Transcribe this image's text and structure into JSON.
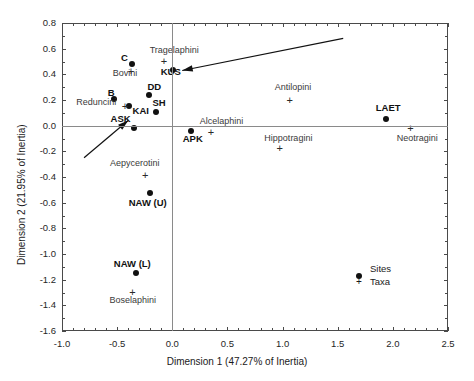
{
  "chart_data": {
    "type": "scatter",
    "title": "",
    "xlabel": "Dimension 1 (47.27% of Inertia)",
    "ylabel": "Dimension 2 (21.95% of Inertia)",
    "xlim": [
      -1.0,
      2.5
    ],
    "ylim": [
      -1.6,
      0.8
    ],
    "xticks": [
      "-1.0",
      "-0.5",
      "0.0",
      "0.5",
      "1.0",
      "1.5",
      "2.0",
      "2.5"
    ],
    "xtick_values": [
      -1.0,
      -0.5,
      0.0,
      0.5,
      1.0,
      1.5,
      2.0,
      2.5
    ],
    "yticks": [
      "0.8",
      "0.6",
      "0.4",
      "0.2",
      "0.0",
      "-0.2",
      "-0.4",
      "-0.6",
      "-0.8",
      "-1.0",
      "-1.2",
      "-1.4",
      "-1.6"
    ],
    "ytick_values": [
      0.8,
      0.6,
      0.4,
      0.2,
      0.0,
      -0.2,
      -0.4,
      -0.6,
      -0.8,
      -1.0,
      -1.2,
      -1.4,
      -1.6
    ],
    "grid": false,
    "zero_lines": true,
    "legend": {
      "position": "bottom-right",
      "entries": [
        {
          "label": "Sites",
          "marker": "filled-circle"
        },
        {
          "label": "Taxa",
          "marker": "plus"
        }
      ]
    },
    "series": [
      {
        "name": "Sites",
        "marker": "filled-circle",
        "points": [
          {
            "label": "C",
            "x": -0.365,
            "y": 0.48,
            "lx": -0.465,
            "ly": 0.53
          },
          {
            "label": "KUS",
            "x": 0.01,
            "y": 0.435,
            "lx": -0.105,
            "ly": 0.415
          },
          {
            "label": "DD",
            "x": -0.215,
            "y": 0.24,
            "lx": -0.225,
            "ly": 0.305
          },
          {
            "label": "B",
            "x": -0.53,
            "y": 0.21,
            "lx": -0.585,
            "ly": 0.258
          },
          {
            "label": "KAI",
            "x": -0.395,
            "y": 0.15,
            "lx": -0.36,
            "ly": 0.118
          },
          {
            "label": "SH",
            "x": -0.15,
            "y": 0.11,
            "lx": -0.18,
            "ly": 0.175
          },
          {
            "label": "ASK",
            "x": -0.345,
            "y": -0.015,
            "lx": -0.56,
            "ly": 0.053
          },
          {
            "label": "APK",
            "x": 0.17,
            "y": -0.04,
            "lx": 0.095,
            "ly": -0.105
          },
          {
            "label": "LAET",
            "x": 1.935,
            "y": 0.055,
            "lx": 1.845,
            "ly": 0.14
          },
          {
            "label": "NAW (U)",
            "x": -0.205,
            "y": -0.525,
            "lx": -0.395,
            "ly": -0.6
          },
          {
            "label": "NAW (L)",
            "x": -0.33,
            "y": -1.15,
            "lx": -0.53,
            "ly": -1.075
          }
        ]
      },
      {
        "name": "Taxa",
        "marker": "plus",
        "points": [
          {
            "label": "Tragelaphini",
            "x": -0.075,
            "y": 0.5,
            "lx": -0.205,
            "ly": 0.585
          },
          {
            "label": "Bovini",
            "x": -0.375,
            "y": 0.425,
            "lx": -0.54,
            "ly": 0.4
          },
          {
            "label": "Reduncini",
            "x": -0.43,
            "y": 0.148,
            "lx": -0.87,
            "ly": 0.175
          },
          {
            "label": "Antilopini",
            "x": 1.065,
            "y": 0.2,
            "lx": 0.93,
            "ly": 0.29
          },
          {
            "label": "Alcelaphini",
            "x": 0.35,
            "y": -0.05,
            "lx": 0.25,
            "ly": 0.027
          },
          {
            "label": "Neotragini",
            "x": 2.16,
            "y": -0.025,
            "lx": 2.035,
            "ly": -0.1
          },
          {
            "label": "Hippotragini",
            "x": 0.975,
            "y": -0.175,
            "lx": 0.835,
            "ly": -0.103
          },
          {
            "label": "Aepycerotini",
            "x": -0.245,
            "y": -0.385,
            "lx": -0.565,
            "ly": -0.3
          },
          {
            "label": "Boselaphini",
            "x": -0.36,
            "y": -1.3,
            "lx": -0.57,
            "ly": -1.365
          }
        ]
      }
    ],
    "annotations": [
      {
        "name": "arrow-to-kus",
        "x1": 1.55,
        "y1": 0.68,
        "x2": 0.09,
        "y2": 0.43
      },
      {
        "name": "arrow-to-ask",
        "x1": -0.8,
        "y1": -0.25,
        "x2": -0.4,
        "y2": 0.04
      }
    ]
  }
}
